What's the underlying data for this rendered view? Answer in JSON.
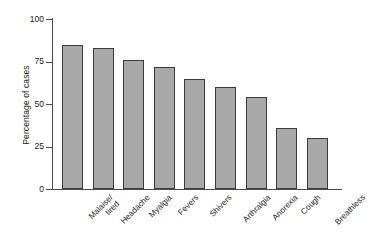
{
  "chart_data": {
    "type": "bar",
    "title": "",
    "xlabel": "",
    "ylabel": "Percentage of cases",
    "ylim": [
      0,
      100
    ],
    "yticks": [
      "0",
      "25",
      "50",
      "75",
      "100"
    ],
    "ytick_values": [
      0,
      25,
      50,
      75,
      100
    ],
    "grid": false,
    "legend": "none",
    "bar_fill_color": "#a9a9a9",
    "bar_edge_color": "#3b3b3b",
    "axis_color": "#4d4d4d",
    "background_color": "#ffffff",
    "categories": [
      "Malaise/\ntired",
      "Headache",
      "Myalgia",
      "Fevers",
      "Shivers",
      "Arthralgia",
      "Anorexia",
      "Cough",
      "Breathless"
    ],
    "values": [
      85,
      83,
      76,
      72,
      65,
      60,
      54,
      36,
      30
    ]
  }
}
